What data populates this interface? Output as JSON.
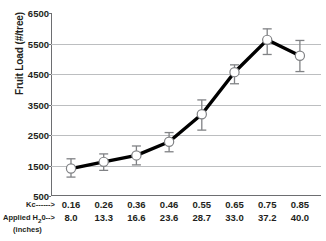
{
  "chart_data": {
    "type": "line",
    "title": "",
    "xlabel": "",
    "ylabel": "Fruit Load (#/tree)",
    "ylim": [
      500,
      6500
    ],
    "ytick_values": [
      6500,
      5500,
      4500,
      3500,
      2500,
      1500,
      500
    ],
    "ytick_labels": [
      "6500",
      "5500",
      "4500",
      "3500",
      "2500",
      "1500",
      "500"
    ],
    "grid": "horizontal",
    "legend": "none",
    "categories": [
      "0.16",
      "0.26",
      "0.36",
      "0.46",
      "0.55",
      "0.65",
      "0.75",
      "0.85"
    ],
    "secondary_categories": [
      "8.0",
      "13.3",
      "16.6",
      "23.6",
      "28.7",
      "33.0",
      "37.2",
      "40.0"
    ],
    "series": [
      {
        "name": "Fruit Load",
        "values": [
          1400,
          1620,
          1830,
          2280,
          3180,
          4560,
          5620,
          5100
        ],
        "errors_low": [
          1120,
          1340,
          1520,
          1950,
          2660,
          4180,
          5140,
          4580
        ],
        "errors_high": [
          1720,
          1880,
          2140,
          2580,
          3650,
          4800,
          5980,
          5600
        ],
        "marker": "open-circle",
        "color": "#000000"
      }
    ],
    "axis_rows": [
      {
        "label": "Kc------>",
        "values": [
          "0.16",
          "0.26",
          "0.36",
          "0.46",
          "0.55",
          "0.65",
          "0.75",
          "0.85"
        ]
      },
      {
        "label": "Applied H20-->",
        "values": [
          "8.0",
          "13.3",
          "16.6",
          "23.6",
          "28.7",
          "33.0",
          "37.2",
          "40.0"
        ]
      }
    ],
    "axis_row_sublabel": "(inches)",
    "colors": {
      "line": "#000000",
      "grid": "#bcbec0",
      "axis": "#6d6e71",
      "marker_fill": "#ffffff",
      "errorbar": "#808285",
      "text": "#231f20"
    }
  },
  "labels": {
    "kc_row_label": "Kc------>",
    "h2o_row_label_pre": "Applied H",
    "h2o_row_label_sub": "2",
    "h2o_row_label_post": "0-->",
    "inches_label": "(inches)"
  }
}
